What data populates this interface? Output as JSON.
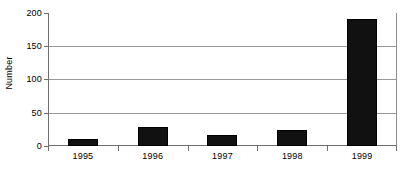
{
  "chart_data": {
    "type": "bar",
    "title": "",
    "subtitle": "",
    "xlabel": "",
    "ylabel": "Number",
    "categories": [
      "1995",
      "1996",
      "1997",
      "1998",
      "1999"
    ],
    "values": [
      10,
      29,
      16,
      24,
      191
    ],
    "series": [
      {
        "name": "Number",
        "values": [
          10,
          29,
          16,
          24,
          191
        ]
      }
    ],
    "ylim": [
      0,
      200
    ],
    "yticks": [
      0,
      50,
      100,
      150,
      200
    ],
    "ytick_labels": [
      "0",
      "50",
      "100",
      "150",
      "200"
    ],
    "grid": "horizontal",
    "legend": "none",
    "bar_color": "#111111",
    "gridline_color": "#9a9a9a",
    "axis_color": "#6e6e6e",
    "background_color": "#ffffff",
    "annotations": []
  }
}
